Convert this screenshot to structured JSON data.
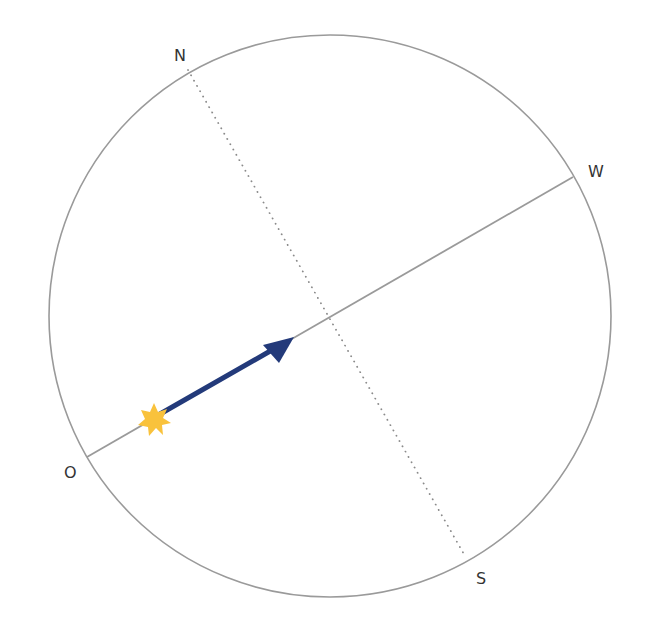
{
  "diagram": {
    "type": "celestial-sphere-horizon",
    "circle": {
      "cx": 330,
      "cy": 316,
      "r": 281,
      "stroke": "#9a9a9a"
    },
    "horizon_line": {
      "from": "O",
      "to": "W",
      "x1": 87,
      "y1": 457,
      "x2": 573,
      "y2": 177,
      "stroke": "#9a9a9a",
      "style": "solid"
    },
    "meridian_line": {
      "from": "N",
      "to": "S",
      "x1": 188,
      "y1": 70,
      "x2": 465,
      "y2": 556,
      "stroke": "#9a9a9a",
      "style": "dotted"
    },
    "labels": {
      "north": "N",
      "west": "W",
      "east": "O",
      "south": "S"
    },
    "arrow": {
      "x1": 160,
      "y1": 414,
      "x2": 294,
      "y2": 337,
      "color": "#233a7a"
    },
    "star": {
      "cx": 154,
      "cy": 420,
      "r_outer": 17,
      "r_inner": 8,
      "points": 7,
      "color": "#f9c23c"
    }
  }
}
